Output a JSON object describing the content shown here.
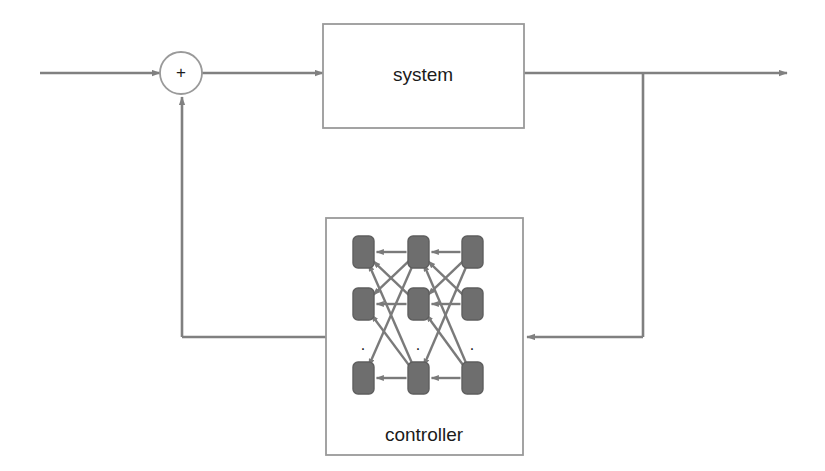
{
  "diagram": {
    "type": "block-diagram",
    "canvas": {
      "width": 825,
      "height": 471
    },
    "colors": {
      "line": "#808080",
      "box_stroke": "#9a9a9a",
      "node_fill": "#6e6e6e",
      "node_stroke": "#5e5e5e",
      "text": "#1b1b1b",
      "background": "#ffffff"
    },
    "blocks": [
      {
        "id": "system",
        "label": "system",
        "x": 323,
        "y": 24,
        "width": 201,
        "height": 104,
        "label_x": 423,
        "label_y": 76
      },
      {
        "id": "controller",
        "label": "controller",
        "x": 326,
        "y": 218,
        "width": 197,
        "height": 237,
        "label_x": 424,
        "label_y": 436
      }
    ],
    "summing_junction": {
      "id": "sum",
      "label": "+",
      "cx": 181,
      "cy": 73,
      "r": 21
    },
    "signals": [
      {
        "id": "reference-input",
        "from_x": 40,
        "from_y": 73,
        "to_x": 160,
        "to_y": 73,
        "arrow": true
      },
      {
        "id": "sum-to-system",
        "from_x": 202,
        "from_y": 73,
        "to_x": 323,
        "to_y": 73,
        "arrow": true
      },
      {
        "id": "system-output",
        "from_x": 524,
        "from_y": 73,
        "to_x": 787,
        "to_y": 73,
        "arrow": true
      },
      {
        "id": "output-tap-down",
        "from_x": 643,
        "from_y": 73,
        "to_x": 643,
        "to_y": 337,
        "arrow": false
      },
      {
        "id": "tap-to-controller",
        "from_x": 643,
        "from_y": 337,
        "to_x": 527,
        "to_y": 337,
        "arrow": true
      },
      {
        "id": "controller-out-left",
        "from_x": 326,
        "from_y": 337,
        "to_x": 182,
        "to_y": 337,
        "arrow": false
      },
      {
        "id": "controller-to-sum",
        "from_x": 182,
        "from_y": 337,
        "to_x": 182,
        "to_y": 97,
        "arrow": true
      }
    ],
    "network": {
      "description": "3x3 grid of rounded-rectangle neurons with dotted row indicating omitted units",
      "columns_x": [
        353,
        408,
        462
      ],
      "rows_y": [
        236,
        288,
        362
      ],
      "node_width": 21,
      "node_height": 32,
      "node_radius": 5,
      "ellipsis_row": {
        "y": 346,
        "dots_x": [
          363,
          418,
          472
        ],
        "glyph": "."
      },
      "nodes": [
        {
          "row": 0,
          "col": 0,
          "x": 353,
          "y": 236
        },
        {
          "row": 0,
          "col": 1,
          "x": 408,
          "y": 236
        },
        {
          "row": 0,
          "col": 2,
          "x": 462,
          "y": 236
        },
        {
          "row": 1,
          "col": 0,
          "x": 353,
          "y": 288
        },
        {
          "row": 1,
          "col": 1,
          "x": 408,
          "y": 288
        },
        {
          "row": 1,
          "col": 2,
          "x": 462,
          "y": 288
        },
        {
          "row": 2,
          "col": 0,
          "x": 353,
          "y": 362
        },
        {
          "row": 2,
          "col": 1,
          "x": 408,
          "y": 362
        },
        {
          "row": 2,
          "col": 2,
          "x": 462,
          "y": 362
        }
      ],
      "edges": [
        {
          "from": [
            0,
            1
          ],
          "to": [
            0,
            0
          ]
        },
        {
          "from": [
            0,
            2
          ],
          "to": [
            0,
            1
          ]
        },
        {
          "from": [
            0,
            1
          ],
          "to": [
            1,
            0
          ]
        },
        {
          "from": [
            0,
            1
          ],
          "to": [
            2,
            0
          ]
        },
        {
          "from": [
            0,
            2
          ],
          "to": [
            1,
            1
          ]
        },
        {
          "from": [
            0,
            2
          ],
          "to": [
            2,
            1
          ]
        },
        {
          "from": [
            1,
            1
          ],
          "to": [
            0,
            0
          ]
        },
        {
          "from": [
            1,
            1
          ],
          "to": [
            1,
            0
          ]
        },
        {
          "from": [
            1,
            2
          ],
          "to": [
            0,
            1
          ]
        },
        {
          "from": [
            1,
            2
          ],
          "to": [
            1,
            1
          ]
        },
        {
          "from": [
            2,
            1
          ],
          "to": [
            0,
            0
          ]
        },
        {
          "from": [
            2,
            1
          ],
          "to": [
            1,
            0
          ]
        },
        {
          "from": [
            2,
            1
          ],
          "to": [
            2,
            0
          ]
        },
        {
          "from": [
            2,
            2
          ],
          "to": [
            0,
            1
          ]
        },
        {
          "from": [
            2,
            2
          ],
          "to": [
            1,
            1
          ]
        },
        {
          "from": [
            2,
            2
          ],
          "to": [
            2,
            1
          ]
        }
      ]
    }
  }
}
